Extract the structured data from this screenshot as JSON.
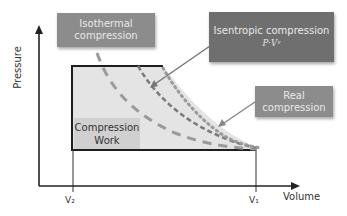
{
  "diagram": {
    "axes": {
      "y_label": "Pressure",
      "x_label": "Volume",
      "x_ticks": [
        "V₂",
        "V₁"
      ]
    },
    "callouts": {
      "isothermal": {
        "line1": "Isothermal",
        "line2": "compression"
      },
      "isentropic": {
        "line1": "Isentropic compression",
        "formula": "P·Vᵞ"
      },
      "real": {
        "line1": "Real",
        "line2": "compression"
      }
    },
    "work_region": {
      "line1": "Compression",
      "line2": "Work"
    },
    "curves": [
      {
        "name": "Isothermal compression",
        "style": "long-dash",
        "color": "#9a9a9a"
      },
      {
        "name": "Isentropic compression",
        "style": "short-dash",
        "color": "#7a7a7a"
      },
      {
        "name": "Real compression",
        "style": "dotted",
        "color": "#9a9a9a"
      }
    ],
    "colors": {
      "callout_light": "#8c8c8c",
      "callout_dark": "#6f6f6f",
      "work_fill": "#e4e4e4",
      "axis": "#222222"
    }
  }
}
